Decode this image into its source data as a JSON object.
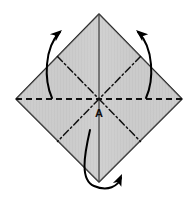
{
  "figure": {
    "type": "origami-fold-diagram",
    "canvas": {
      "width": 196,
      "height": 211
    },
    "background_color": "#ffffff"
  },
  "paper": {
    "shape": "square-rotated-45",
    "name": "square sheet shown as a diamond",
    "fill_color": "#c9c9c9",
    "stroke_color": "#1a1a1a",
    "stroke_width": 1.6,
    "vertices": {
      "top": {
        "x": 99,
        "y": 14
      },
      "right": {
        "x": 182,
        "y": 99
      },
      "bottom": {
        "x": 99,
        "y": 182
      },
      "left": {
        "x": 16,
        "y": 99
      }
    },
    "shading": {
      "style": "vertical-stripe-texture",
      "light": "#d4d4d4",
      "dark": "#bfbfbf"
    }
  },
  "labels": [
    {
      "id": "point-a",
      "text": "A",
      "x": 99,
      "y": 117,
      "description": "center point of the square, where all crease lines meet"
    }
  ],
  "crease_lines": [
    {
      "id": "crease-horizontal",
      "name": "horizontal-valley-crease",
      "style": "dashed",
      "meaning": "valley fold",
      "from": {
        "x": 16,
        "y": 99
      },
      "to": {
        "x": 182,
        "y": 99
      },
      "dash_pattern": "6,4",
      "color": "#111111",
      "width": 1.8
    },
    {
      "id": "crease-vertical",
      "name": "vertical-fold-edge",
      "style": "solid",
      "meaning": "existing folded edge / ridge",
      "from": {
        "x": 99,
        "y": 14
      },
      "to": {
        "x": 99,
        "y": 182
      },
      "color": "#3a3a3a",
      "width": 1.2
    },
    {
      "id": "crease-diagonal-nw",
      "name": "diagonal-crease-upper-left",
      "style": "dash-dot",
      "meaning": "mountain fold",
      "from": {
        "x": 57.5,
        "y": 56.5
      },
      "to": {
        "x": 99,
        "y": 99
      },
      "dash_pattern": "7,3,1.6,3",
      "color": "#111111",
      "width": 1.5
    },
    {
      "id": "crease-diagonal-ne",
      "name": "diagonal-crease-upper-right",
      "style": "dash-dot",
      "meaning": "mountain fold",
      "from": {
        "x": 140.5,
        "y": 56.5
      },
      "to": {
        "x": 99,
        "y": 99
      },
      "dash_pattern": "7,3,1.6,3",
      "color": "#111111",
      "width": 1.5
    },
    {
      "id": "crease-diagonal-sw",
      "name": "diagonal-crease-lower-left",
      "style": "dash-dot",
      "meaning": "mountain fold",
      "from": {
        "x": 99,
        "y": 99
      },
      "to": {
        "x": 57.5,
        "y": 141.5
      },
      "dash_pattern": "7,3,1.6,3",
      "color": "#111111",
      "width": 1.5
    },
    {
      "id": "crease-diagonal-se",
      "name": "diagonal-crease-lower-right",
      "style": "dash-dot",
      "meaning": "mountain fold",
      "from": {
        "x": 99,
        "y": 99
      },
      "to": {
        "x": 140.5,
        "y": 141.5
      },
      "dash_pattern": "7,3,1.6,3",
      "color": "#111111",
      "width": 1.5
    }
  ],
  "arrows": [
    {
      "id": "arrow-top-left",
      "name": "fold-arrow-upper-left",
      "direction": "up-right",
      "description": "curved arrow sweeping from the left fold line upward over the top-left edge",
      "path": "M 52,98 C 44,80 44,48 60,32",
      "head": {
        "x": 60,
        "y": 32,
        "angle": -42
      },
      "color": "#000000",
      "width": 2.0
    },
    {
      "id": "arrow-top-right",
      "name": "fold-arrow-upper-right",
      "direction": "up-left",
      "description": "curved arrow sweeping from the right fold line upward over the top-right edge",
      "path": "M 146,98 C 154,80 154,48 138,32",
      "head": {
        "x": 138,
        "y": 32,
        "angle": 222
      },
      "color": "#000000",
      "width": 2.0
    },
    {
      "id": "arrow-bottom",
      "name": "fold-arrow-bottom-wrap",
      "direction": "right-up",
      "description": "arrow looping down around the bottom vertex and curling back up to the right",
      "path": "M 90,130 C 84,156 80,180 94,186 C 108,192 118,186 121,178",
      "head": {
        "x": 121,
        "y": 178,
        "angle": -62
      },
      "color": "#000000",
      "width": 2.0
    }
  ],
  "arrowhead": {
    "style": "narrow-filled-triangle",
    "fill": "#000000",
    "length": 11,
    "half_width": 4.2
  }
}
